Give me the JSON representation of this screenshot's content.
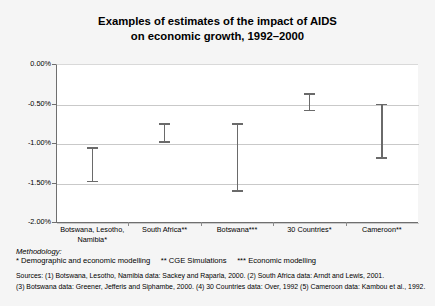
{
  "chart_data": {
    "type": "bar",
    "title": "Examples of estimates of the impact of AIDS on economic growth, 1992–2000",
    "title_line1": "Examples of estimates of the impact of AIDS",
    "title_line2": "on economic growth, 1992–2000",
    "xlabel": "",
    "ylabel": "",
    "ylim": [
      -2.0,
      0.0
    ],
    "yticks": [
      "0.00%",
      "-0.50%",
      "-1.00%",
      "-1.50%",
      "-2.00%"
    ],
    "ytick_values": [
      0.0,
      -0.5,
      -1.0,
      -1.5,
      -2.0
    ],
    "grid": true,
    "legend": "none",
    "categories": [
      "Botswana, Lesotho, Namibia*",
      "South Africa**",
      "Botswana***",
      "30 Countries*",
      "Cameroon**"
    ],
    "category_lines": [
      [
        "Botswana, Lesotho,",
        "Namibia*"
      ],
      [
        "South Africa**"
      ],
      [
        "Botswana***"
      ],
      [
        "30 Countries*"
      ],
      [
        "Cameroon**"
      ]
    ],
    "series": [
      {
        "name": "Estimated impact on economic growth (range)",
        "ranges": [
          {
            "category": "Botswana, Lesotho, Namibia*",
            "high": -1.05,
            "low": -1.5
          },
          {
            "category": "South Africa**",
            "high": -0.75,
            "low": -1.0
          },
          {
            "category": "Botswana***",
            "high": -0.75,
            "low": -1.62
          },
          {
            "category": "30 Countries*",
            "high": -0.37,
            "low": -0.6
          },
          {
            "category": "Cameroon**",
            "high": -0.5,
            "low": -1.2
          }
        ]
      }
    ]
  },
  "footnotes": {
    "methodology_heading": "Methodology:",
    "methodology_line": "* Demographic and economic modelling     ** CGE Simulations     *** Economic modelling",
    "sources_line_1": "Sources: (1) Botswana, Lesotho, Namibia data: Sackey and Raparla, 2000. (2) South Africa data: Arndt and Lewis, 2001.",
    "sources_line_2": "(3) Botswana data: Greener, Jefferis and Siphambe, 2000. (4) 30 Countries data: Over, 1992 (5) Cameroon data: Kambou et al., 1992."
  },
  "colors": {
    "background": "#f5f5f5",
    "plot_background": "#ffffff",
    "gridline": "#c9c9c9",
    "axis": "#6f6f6f",
    "errorbar": "#6a6a6a",
    "text": "#000000"
  }
}
